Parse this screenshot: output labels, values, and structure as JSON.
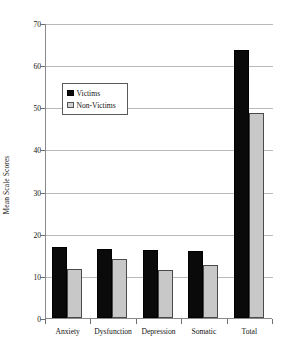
{
  "chart_data": {
    "type": "bar",
    "title": "",
    "subtitle": "",
    "xlabel": "",
    "ylabel": "Mean Scale Scores",
    "categories": [
      "Anxiety",
      "Dysfunction",
      "Depression",
      "Somatic",
      "Total"
    ],
    "series": [
      {
        "name": "Victims",
        "color": "#0a0a0a",
        "values": [
          16.9,
          16.3,
          16.2,
          15.8,
          63.6
        ]
      },
      {
        "name": "Non-Victims",
        "color": "#c8c8c8",
        "values": [
          11.6,
          14.1,
          11.3,
          12.5,
          48.7
        ]
      }
    ],
    "ylim": [
      0,
      70
    ],
    "yticks": [
      0,
      10,
      20,
      30,
      40,
      50,
      60,
      70
    ],
    "ytick_labels": [
      "0",
      "10",
      "20",
      "30",
      "40",
      "50",
      "60",
      "70"
    ],
    "grid": true,
    "grid_axis": "y",
    "legend_position": "upper-left-inside",
    "legend_entries": [
      "Victims",
      "Non-Victims"
    ]
  },
  "legend": {
    "items": [
      {
        "label": "Victims"
      },
      {
        "label": "Non-Victims"
      }
    ]
  }
}
